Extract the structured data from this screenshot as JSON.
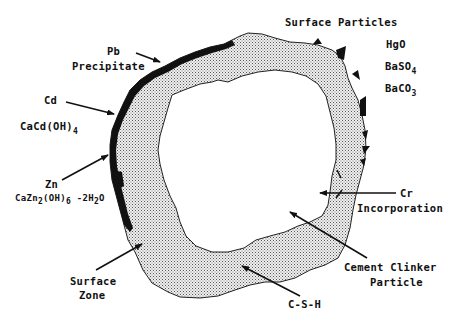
{
  "diagram": {
    "colors": {
      "background": "#ffffff",
      "ink": "#111111",
      "csh_fill_base": "#e8e8e8",
      "precipitate": "#111111"
    },
    "labels": {
      "surface_particles": {
        "text": "Surface Particles"
      },
      "hgo": {
        "text": "HgO"
      },
      "baso4": {
        "main": "BaSO",
        "sub": "4"
      },
      "baco3": {
        "main": "BaCO",
        "sub": "3"
      },
      "pb_line1": {
        "text": "Pb"
      },
      "pb_line2": {
        "text": "Precipitate"
      },
      "cd": {
        "text": "Cd"
      },
      "cacdoh4": {
        "main": "CaCd(OH)",
        "sub": "4"
      },
      "zn": {
        "text": "Zn"
      },
      "zn_formula": {
        "p1": "CaZn",
        "s1": "2",
        "p2": "(OH)",
        "s2": "6",
        "p3": " -2H",
        "s3": "2",
        "p4": "O"
      },
      "cr_line1": {
        "text": "Cr"
      },
      "cr_line2": {
        "text": "Incorporation"
      },
      "clinker_line1": {
        "text": "Cement Clinker"
      },
      "clinker_line2": {
        "text": "Particle"
      },
      "surface_zone_line1": {
        "text": "Surface"
      },
      "surface_zone_line2": {
        "text": "Zone"
      },
      "csh": {
        "text": "C-S-H"
      }
    },
    "regions": [
      {
        "name": "cement-clinker-particle",
        "fill": "white"
      },
      {
        "name": "surface-zone-csh",
        "fill": "stippled gray"
      },
      {
        "name": "precipitate-layer",
        "fill": "black",
        "side": "upper-left"
      },
      {
        "name": "surface-particles",
        "fill": "black",
        "side": "right"
      }
    ]
  }
}
